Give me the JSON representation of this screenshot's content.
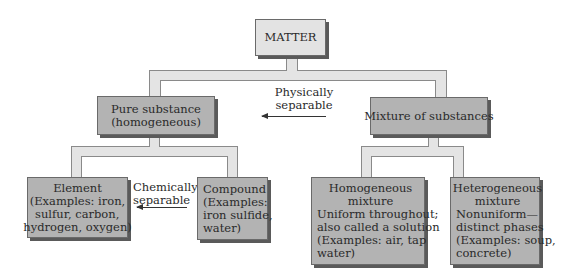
{
  "diagram": {
    "root": {
      "label": "MATTER"
    },
    "level2": [
      {
        "id": "pure",
        "lines": [
          "Pure substance",
          "(homogeneous)"
        ]
      },
      {
        "id": "mixture",
        "lines": [
          "Mixture of substances"
        ]
      }
    ],
    "level3": {
      "element": {
        "lines": [
          "Element",
          "(Examples: iron,",
          "sulfur, carbon,",
          "hydrogen, oxygen)"
        ]
      },
      "compound": {
        "lines": [
          "Compound",
          "(Examples:",
          "iron sulfide,",
          "water)"
        ]
      },
      "homogeneous": {
        "lines": [
          "Homogeneous",
          "mixture",
          "Uniform throughout;",
          "also called a solution",
          "(Examples: air, tap",
          "water)"
        ]
      },
      "heterogeneous": {
        "lines": [
          "Heterogeneous",
          "mixture",
          "Nonuniform—",
          "distinct phases",
          "(Examples: soup,",
          "concrete)"
        ]
      }
    },
    "annotations": {
      "physical": [
        "Physically",
        "separable"
      ],
      "chemical": [
        "Chemically",
        "separable"
      ]
    },
    "colors": {
      "root_fill": "#e3e3e3",
      "level2_fill": "#b3b3b3",
      "level3_fill": "#b3b3b3",
      "connector_fill": "#e4e4e4",
      "outline": "#6a6a6a"
    }
  }
}
